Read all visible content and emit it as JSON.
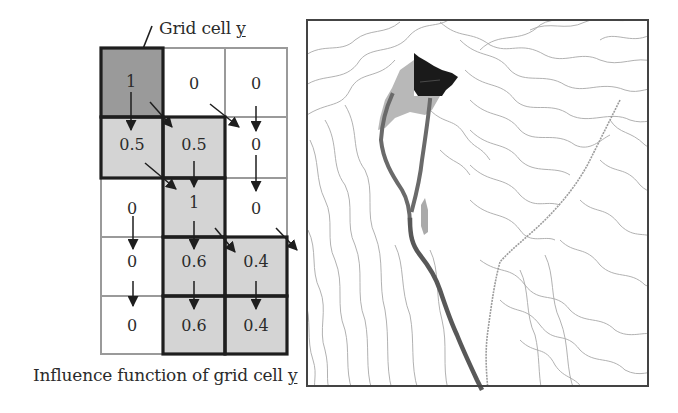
{
  "figure": {
    "top_label_prefix": "Grid cell ",
    "top_label_var": "y",
    "bottom_label_prefix": "Influence function of grid cell ",
    "bottom_label_var": "y"
  },
  "grid": {
    "rows": 5,
    "cols": 3,
    "values": [
      [
        "1",
        "0",
        "0"
      ],
      [
        "0.5",
        "0.5",
        "0"
      ],
      [
        "0",
        "1",
        "0"
      ],
      [
        "0",
        "0.6",
        "0.4"
      ],
      [
        "0",
        "0.6",
        "0.4"
      ]
    ],
    "shading": [
      [
        "source",
        "none",
        "none"
      ],
      [
        "influenced",
        "influenced",
        "none"
      ],
      [
        "none",
        "influenced",
        "none"
      ],
      [
        "none",
        "influenced",
        "influenced"
      ],
      [
        "none",
        "influenced",
        "influenced"
      ]
    ],
    "colors": {
      "source": "#9a9a9a",
      "influenced": "#d4d4d4",
      "none": "#ffffff",
      "thin_line": "#9a9a9a",
      "thick_line": "#1e1e1e"
    }
  },
  "map": {
    "description": "Contour map with flow path from source cell",
    "colors": {
      "contour": "#a8a8a8",
      "source_area": "#1a1a1a",
      "spread_area": "#b8b8b8",
      "flow_path": "#6a6a6a",
      "frame": "#444444"
    }
  }
}
